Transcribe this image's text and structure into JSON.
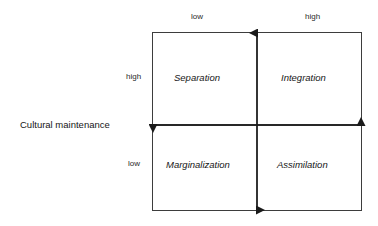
{
  "diagram": {
    "type": "2x2-quadrant-matrix",
    "vertical_axis": {
      "caption": "Cultural maintenance",
      "high_label": "high",
      "low_label": "low"
    },
    "horizontal_axis": {
      "caption": "",
      "low_label": "low",
      "high_label": "high"
    },
    "quadrants": [
      {
        "id": "top-left",
        "label": "Separation"
      },
      {
        "id": "top-right",
        "label": "Integration"
      },
      {
        "id": "bottom-left",
        "label": "Marginalization"
      },
      {
        "id": "bottom-right",
        "label": "Assimilation"
      }
    ],
    "style": {
      "line_color": "#3d3d3d",
      "arrow_color": "#1a1a1a",
      "text_color": "#161616",
      "background": "#ffffff"
    }
  }
}
